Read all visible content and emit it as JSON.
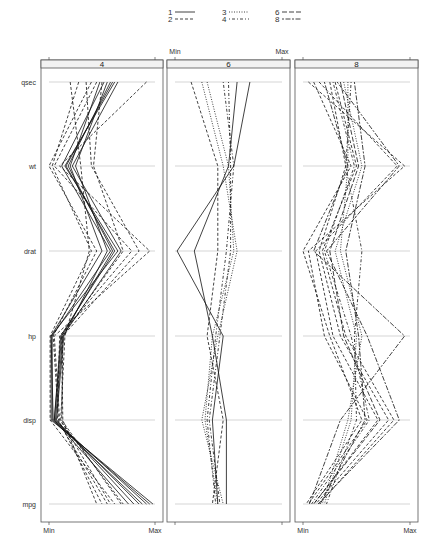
{
  "chart_data": {
    "type": "parallel-coordinates",
    "title": "",
    "variables": [
      "qsec",
      "wt",
      "drat",
      "hp",
      "disp",
      "mpg"
    ],
    "axis_labels": {
      "min": "Min",
      "max": "Max"
    },
    "panels": [
      {
        "label": "4",
        "lines": [
          {
            "group": "1",
            "values": [
              0.62,
              0.15,
              0.65,
              0.02,
              0.02,
              0.98
            ]
          },
          {
            "group": "1",
            "values": [
              0.58,
              0.18,
              0.6,
              0.12,
              0.05,
              0.92
            ]
          },
          {
            "group": "1",
            "values": [
              0.65,
              0.22,
              0.68,
              0.13,
              0.06,
              0.85
            ]
          },
          {
            "group": "1",
            "values": [
              0.52,
              0.12,
              0.58,
              0.03,
              0.03,
              0.95
            ]
          },
          {
            "group": "1",
            "values": [
              0.55,
              0.25,
              0.55,
              0.14,
              0.07,
              0.8
            ]
          },
          {
            "group": "1",
            "values": [
              0.48,
              0.2,
              0.5,
              0.02,
              0.04,
              0.88
            ]
          },
          {
            "group": "1",
            "values": [
              0.6,
              0.16,
              0.62,
              0.11,
              0.05,
              0.75
            ]
          },
          {
            "group": "2",
            "values": [
              0.92,
              0.1,
              0.95,
              0.05,
              0.1,
              0.7
            ]
          },
          {
            "group": "2",
            "values": [
              0.28,
              0.03,
              0.4,
              0.01,
              0.01,
              0.62
            ]
          },
          {
            "group": "2",
            "values": [
              0.35,
              0.4,
              0.85,
              0.13,
              0.12,
              0.68
            ]
          },
          {
            "group": "2",
            "values": [
              0.45,
              0.05,
              0.78,
              0.1,
              0.08,
              0.55
            ]
          },
          {
            "group": "2",
            "values": [
              0.4,
              0.0,
              0.45,
              0.04,
              0.09,
              0.5
            ]
          },
          {
            "group": "2",
            "values": [
              0.2,
              0.3,
              0.38,
              0.15,
              0.11,
              0.58
            ]
          },
          {
            "group": "2",
            "values": [
              0.5,
              0.42,
              0.7,
              0.12,
              0.13,
              0.45
            ]
          }
        ]
      },
      {
        "label": "6",
        "lines": [
          {
            "group": "1",
            "values": [
              0.7,
              0.55,
              0.02,
              0.45,
              0.35,
              0.4
            ]
          },
          {
            "group": "1",
            "values": [
              0.58,
              0.5,
              0.18,
              0.35,
              0.48,
              0.48
            ]
          },
          {
            "group": "2",
            "values": [
              0.15,
              0.4,
              0.4,
              0.3,
              0.45,
              0.35
            ]
          },
          {
            "group": "3",
            "values": [
              0.25,
              0.45,
              0.58,
              0.4,
              0.25,
              0.45
            ]
          },
          {
            "group": "3",
            "values": [
              0.3,
              0.5,
              0.55,
              0.35,
              0.28,
              0.4
            ]
          },
          {
            "group": "4",
            "values": [
              0.45,
              0.55,
              0.48,
              0.38,
              0.3,
              0.38
            ]
          },
          {
            "group": "4",
            "values": [
              0.5,
              0.52,
              0.52,
              0.42,
              0.32,
              0.42
            ]
          }
        ]
      },
      {
        "label": "8",
        "lines": [
          {
            "group": "2",
            "values": [
              0.05,
              0.95,
              0.05,
              0.2,
              0.6,
              0.05
            ]
          },
          {
            "group": "2",
            "values": [
              0.15,
              0.88,
              0.12,
              0.28,
              0.7,
              0.1
            ]
          },
          {
            "group": "2",
            "values": [
              0.25,
              0.4,
              0.15,
              0.35,
              0.8,
              0.12
            ]
          },
          {
            "group": "2",
            "values": [
              0.1,
              0.45,
              0.0,
              0.25,
              0.55,
              0.03
            ]
          },
          {
            "group": "2",
            "values": [
              0.3,
              0.5,
              0.18,
              0.4,
              0.85,
              0.15
            ]
          },
          {
            "group": "3",
            "values": [
              0.38,
              0.55,
              0.3,
              0.5,
              0.45,
              0.2
            ]
          },
          {
            "group": "3",
            "values": [
              0.42,
              0.42,
              0.35,
              0.55,
              0.42,
              0.18
            ]
          },
          {
            "group": "4",
            "values": [
              0.28,
              0.48,
              0.2,
              0.45,
              0.62,
              0.08
            ]
          },
          {
            "group": "4",
            "values": [
              0.45,
              0.4,
              0.55,
              0.48,
              0.5,
              0.22
            ]
          },
          {
            "group": "6",
            "values": [
              0.35,
              0.52,
              0.25,
              0.38,
              0.72,
              0.1
            ]
          },
          {
            "group": "8",
            "values": [
              0.2,
              0.42,
              0.1,
              0.95,
              0.35,
              0.06
            ]
          },
          {
            "group": "8",
            "values": [
              0.32,
              0.9,
              0.22,
              0.6,
              0.9,
              0.14
            ]
          },
          {
            "group": "8",
            "values": [
              0.48,
              0.58,
              0.4,
              0.52,
              0.58,
              0.16
            ]
          }
        ]
      }
    ],
    "legend": {
      "position": "top",
      "entries": [
        {
          "label": "1",
          "style": "solid"
        },
        {
          "label": "2",
          "style": "dashed"
        },
        {
          "label": "3",
          "style": "dotted"
        },
        {
          "label": "4",
          "style": "dotdash"
        },
        {
          "label": "6",
          "style": "longdash"
        },
        {
          "label": "8",
          "style": "twodash"
        }
      ]
    },
    "grid": true
  },
  "colors": {
    "line": "#111111",
    "grid": "#bbbbbb",
    "panel_border": "#555555",
    "strip_bg": "#f2f2f2"
  }
}
